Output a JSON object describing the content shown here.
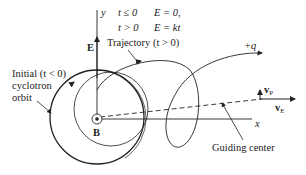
{
  "figure": {
    "axis_x_label": "x",
    "axis_y_label": "y",
    "field_label": "E",
    "magnetic_field_label": "B",
    "condition_line1": {
      "t": "t ≤ 0",
      "E": "E = 0,"
    },
    "condition_line2": {
      "t": "t > 0",
      "E": "E = kt"
    },
    "trajectory_label": "Trajectory (t > 0)",
    "initial_orbit_label": [
      "Initial (t < 0)",
      "cyclotron",
      "orbit"
    ],
    "charge_label": "+q",
    "guiding_center_label": "Guiding center",
    "velocity_p_label": {
      "main": "v",
      "sub": "P"
    },
    "velocity_e_label": {
      "main": "v",
      "sub": "E"
    }
  },
  "colors": {
    "line": "#222222",
    "background": "#ffffff"
  }
}
